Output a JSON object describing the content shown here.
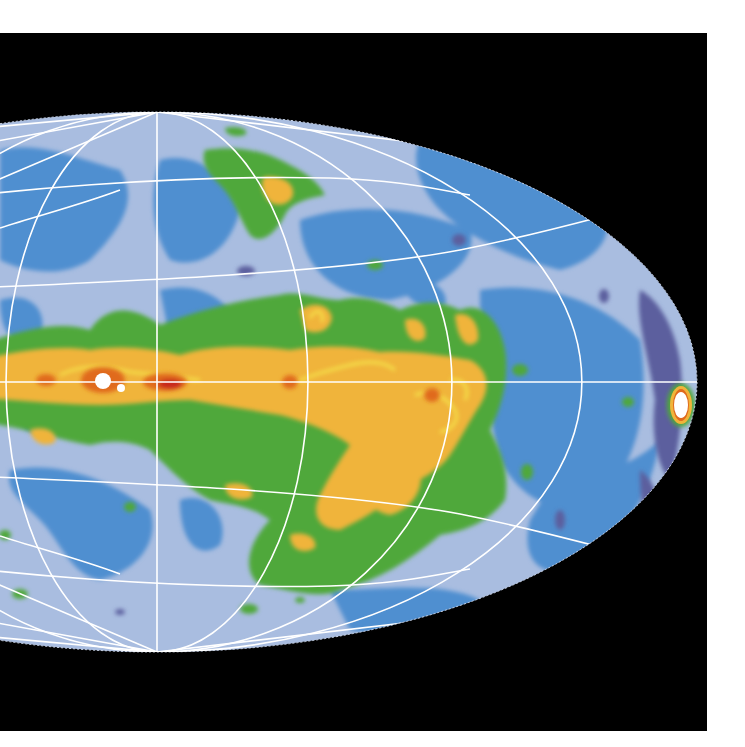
{
  "figure": {
    "type": "all-sky map",
    "projection": "Hammer-Aitoff (elliptical, 2:1)",
    "background_color": "#000000",
    "page_color": "#ffffff",
    "gridline_color": "#ffffff",
    "center": {
      "x": 157,
      "y": 382
    },
    "semi_axes": {
      "a": 540,
      "b": 270
    },
    "meridian_equator_crossings_px": [
      157,
      308,
      452,
      582,
      697
    ],
    "parallels_on_central_meridian_px": [
      177,
      280,
      382,
      483,
      580
    ],
    "color_scale": [
      {
        "level": "lowest",
        "color": "#5b5f9e",
        "label": "dark violet"
      },
      {
        "level": "low",
        "color": "#4f8fd0",
        "label": "medium blue"
      },
      {
        "level": "low-mid",
        "color": "#a9bde0",
        "label": "pale blue"
      },
      {
        "level": "mid",
        "color": "#4fa83a",
        "label": "green"
      },
      {
        "level": "mid-high",
        "color": "#f0b43a",
        "label": "orange-yellow"
      },
      {
        "level": "high",
        "color": "#f4e04a",
        "label": "yellow contour"
      },
      {
        "level": "higher",
        "color": "#e06a1c",
        "label": "orange"
      },
      {
        "level": "very high",
        "color": "#c8281a",
        "label": "red"
      },
      {
        "level": "saturated",
        "color": "#ffffff",
        "label": "white"
      }
    ],
    "features": [
      {
        "name": "galactic plane band",
        "description": "bright yellow/orange band along the equator"
      },
      {
        "name": "bright source near center",
        "x": 103,
        "y": 382
      },
      {
        "name": "secondary bright source",
        "x": 121,
        "y": 388
      },
      {
        "name": "bright source at right edge",
        "x": 681,
        "y": 405
      },
      {
        "name": "large lobe below plane",
        "x": 420,
        "y": 470
      },
      {
        "name": "northern green patch",
        "x": 270,
        "y": 170
      }
    ]
  }
}
